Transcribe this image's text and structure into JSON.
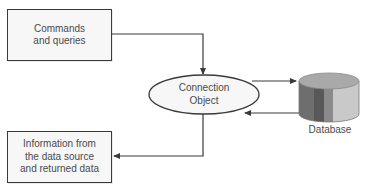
{
  "diagram": {
    "nodes": {
      "commands": {
        "lines": [
          "Commands",
          "and queries"
        ],
        "shape": "rectangle"
      },
      "connection": {
        "lines": [
          "Connection",
          "Object"
        ],
        "shape": "ellipse"
      },
      "database": {
        "label": "Database",
        "shape": "cylinder"
      },
      "info": {
        "lines": [
          "Information from",
          "the data source",
          "and returned data"
        ],
        "shape": "rectangle"
      }
    },
    "edges": [
      {
        "from": "commands",
        "to": "connection",
        "label": ""
      },
      {
        "from": "connection",
        "to": "database",
        "label": ""
      },
      {
        "from": "database",
        "to": "connection",
        "label": ""
      },
      {
        "from": "connection",
        "to": "info",
        "label": ""
      }
    ],
    "colors": {
      "stroke": "#3a3a3a",
      "box_fill": "#f7f7f7",
      "text": "#4a4a4a",
      "cyl_top": "#a9a9a9",
      "cyl_band_1": "#6e6e6e",
      "cyl_band_2": "#585858",
      "cyl_band_3": "#8a8a8a",
      "cyl_band_4": "#c9c9c9"
    }
  }
}
